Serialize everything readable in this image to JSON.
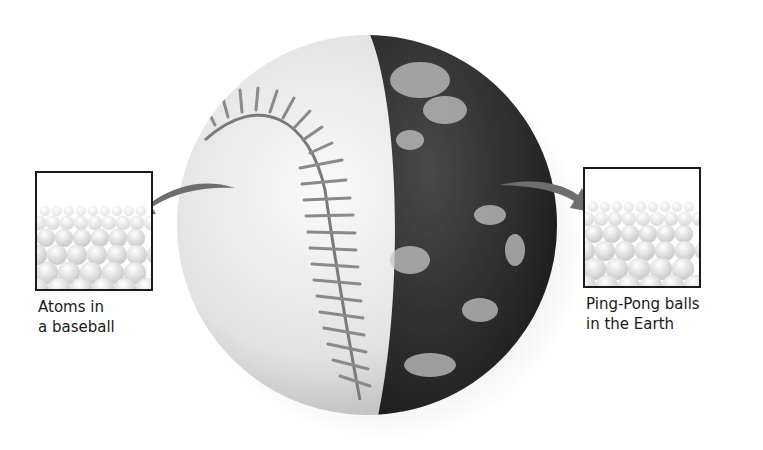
{
  "figure": {
    "sphere": {
      "left_half": "baseball",
      "right_half": "earth"
    },
    "left_inset": {
      "content": "packed-spheres",
      "caption_line1": "Atoms in",
      "caption_line2": "a baseball"
    },
    "right_inset": {
      "content": "packed-spheres",
      "caption_line1": "Ping-Pong balls",
      "caption_line2": "in the Earth"
    },
    "colors": {
      "arrow": "#6e6e6e",
      "box_border": "#1a1a1a",
      "baseball": "#e6e6e6",
      "stitch": "#8a8a8a",
      "earth": "#2a2a2a",
      "clouds": "#bdbdbd"
    }
  }
}
